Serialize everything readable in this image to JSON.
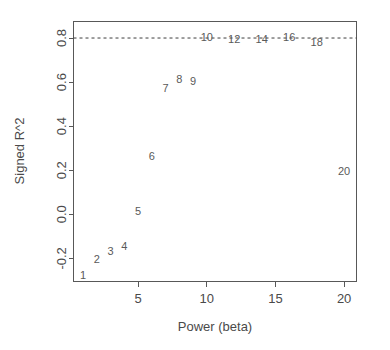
{
  "chart_data": {
    "type": "scatter",
    "title": "",
    "subtitle": "",
    "xlabel": "Power (beta)",
    "ylabel": "Signed R^2",
    "xlim": [
      0.3,
      20.9
    ],
    "ylim": [
      -0.305,
      0.875
    ],
    "xticks": [
      5,
      10,
      15,
      20
    ],
    "xticklabels": [
      "5",
      "10",
      "15",
      "20"
    ],
    "yticks": [
      -0.2,
      0.0,
      0.2,
      0.4,
      0.6,
      0.8
    ],
    "yticklabels": [
      "-0.2",
      "0.0",
      "0.2",
      "0.4",
      "0.6",
      "0.8"
    ],
    "grid": false,
    "legend": null,
    "marker_style": "text-label",
    "annotations": [
      {
        "type": "hline",
        "y": 0.8,
        "style": "dashed",
        "color": "#3d3d3d",
        "label": ""
      }
    ],
    "x": [
      1,
      2,
      3,
      4,
      5,
      6,
      7,
      8,
      9,
      10,
      12,
      14,
      16,
      18,
      20
    ],
    "y": [
      -0.28,
      -0.21,
      -0.17,
      -0.15,
      0.01,
      0.26,
      0.57,
      0.61,
      0.6,
      0.8,
      0.79,
      0.79,
      0.8,
      0.775,
      0.19
    ],
    "point_labels": [
      "1",
      "2",
      "3",
      "4",
      "5",
      "6",
      "7",
      "8",
      "9",
      "10",
      "12",
      "14",
      "16",
      "18",
      "20"
    ],
    "points": [
      {
        "label": "1",
        "x": 1,
        "y": -0.28
      },
      {
        "label": "2",
        "x": 2,
        "y": -0.21
      },
      {
        "label": "3",
        "x": 3,
        "y": -0.17
      },
      {
        "label": "4",
        "x": 4,
        "y": -0.15
      },
      {
        "label": "5",
        "x": 5,
        "y": 0.01
      },
      {
        "label": "6",
        "x": 6,
        "y": 0.26
      },
      {
        "label": "7",
        "x": 7,
        "y": 0.57
      },
      {
        "label": "8",
        "x": 8,
        "y": 0.61
      },
      {
        "label": "9",
        "x": 9,
        "y": 0.6
      },
      {
        "label": "10",
        "x": 10,
        "y": 0.8
      },
      {
        "label": "12",
        "x": 12,
        "y": 0.79
      },
      {
        "label": "14",
        "x": 14,
        "y": 0.79
      },
      {
        "label": "16",
        "x": 16,
        "y": 0.8
      },
      {
        "label": "18",
        "x": 18,
        "y": 0.775
      },
      {
        "label": "20",
        "x": 20,
        "y": 0.19
      }
    ]
  },
  "colors": {
    "background": "#ffffff",
    "axis": "#585858",
    "text": "#4a4a4a",
    "point": "#5a5a5a",
    "reference_line": "#3d3d3d"
  }
}
